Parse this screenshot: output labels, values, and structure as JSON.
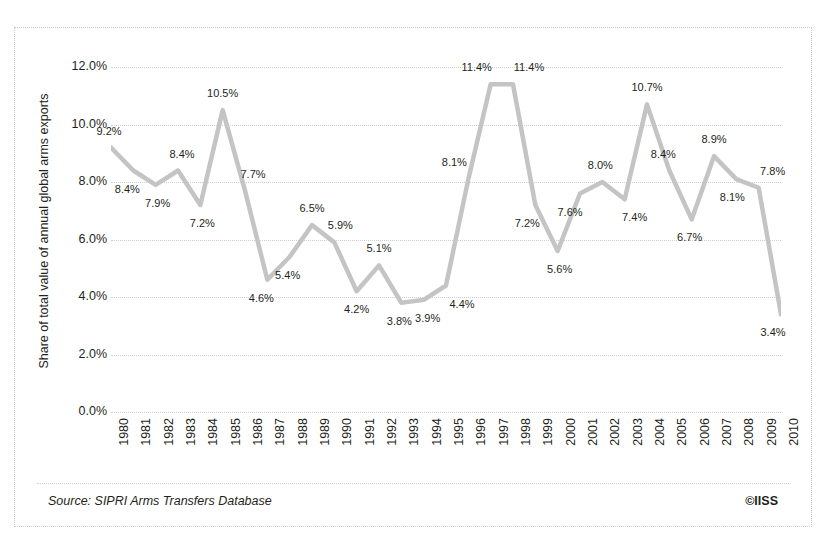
{
  "chart_data": {
    "type": "line",
    "title": "",
    "subtitle": "",
    "xlabel": "",
    "ylabel": "Share of total value of annual global arms exports",
    "categories": [
      "1980",
      "1981",
      "1982",
      "1983",
      "1984",
      "1985",
      "1986",
      "1987",
      "1988",
      "1989",
      "1990",
      "1991",
      "1992",
      "1993",
      "1994",
      "1995",
      "1996",
      "1997",
      "1998",
      "1999",
      "2000",
      "2001",
      "2002",
      "2003",
      "2004",
      "2005",
      "2006",
      "2007",
      "2008",
      "2009",
      "2010"
    ],
    "values": [
      9.2,
      8.4,
      7.9,
      8.4,
      7.2,
      10.5,
      7.7,
      4.6,
      5.4,
      6.5,
      5.9,
      4.2,
      5.1,
      3.8,
      3.9,
      4.4,
      8.1,
      11.4,
      11.4,
      7.2,
      5.6,
      7.6,
      8.0,
      7.4,
      10.7,
      8.4,
      6.7,
      8.9,
      8.1,
      7.8,
      3.4
    ],
    "data_labels": [
      "9.2%",
      "8.4%",
      "7.9%",
      "8.4%",
      "7.2%",
      "10.5%",
      "7.7%",
      "4.6%",
      "5.4%",
      "6.5%",
      "5.9%",
      "4.2%",
      "5.1%",
      "3.8%",
      "3.9%",
      "4.4%",
      "8.1%",
      "11.4%",
      "11.4%",
      "7.2%",
      "5.6%",
      "7.6%",
      "8.0%",
      "7.4%",
      "10.7%",
      "8.4%",
      "6.7%",
      "8.9%",
      "8.1%",
      "7.8%",
      "3.4%"
    ],
    "ylim": [
      0,
      12
    ],
    "ytick_values": [
      0,
      2,
      4,
      6,
      8,
      10,
      12
    ],
    "ytick_labels": [
      "0.0%",
      "2.0%",
      "4.0%",
      "6.0%",
      "8.0%",
      "10.0%",
      "12.0%"
    ],
    "grid": "horizontal-dotted",
    "legend": "none",
    "series_color": "#c4c4c4"
  },
  "footer": {
    "source": "Source: SIPRI Arms Transfers Database",
    "credit": "©IISS"
  }
}
